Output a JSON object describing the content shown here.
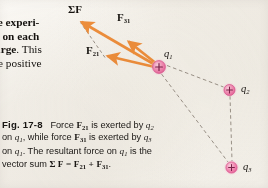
{
  "page": {
    "background_color": "#f5f2ec",
    "width": 268,
    "height": 188
  },
  "body_text": {
    "lines": [
      "ge experi-",
      "g on each",
      "arge. This",
      "ee positive"
    ]
  },
  "caption": {
    "figure_number": "Fig. 17-8",
    "lines": [
      "Force F21 is exerted by q2",
      "on q1, while force F31 is exerted by q3",
      "on q1. The resultant force on q1 is the",
      "vector sum Σ F = F21 + F31."
    ],
    "full_text": "Fig. 17-8  Force F21 is exerted by q2 on q1, while force F31 is exerted by q3 on q1. The resultant force on q1 is the resultant vector sum ΣF = F21 + F31."
  },
  "diagram": {
    "vector_color": "#ef8f3c",
    "charge_fill_color": "#f07ba8",
    "charge_halo_color": "#f6bcd3",
    "dashed_line_color": "#8a8176",
    "labels": {
      "resultant": "ΣF",
      "force_31": "F31",
      "force_21": "F21",
      "charge_1": "q1",
      "charge_2": "q2",
      "charge_3": "q3",
      "charge_sign": "+"
    },
    "charges": [
      {
        "name": "q1",
        "label": "q1",
        "sign": "+",
        "x": 159,
        "y": 67,
        "radius": 7
      },
      {
        "name": "q2",
        "label": "q2",
        "sign": "+",
        "x": 230,
        "y": 89,
        "radius": 6
      },
      {
        "name": "q3",
        "label": "q3",
        "sign": "+",
        "x": 232,
        "y": 168,
        "radius": 6
      }
    ],
    "vectors": [
      {
        "name": "resultant-sum",
        "label": "ΣF",
        "from_x": 159,
        "from_y": 67,
        "to_x": 78,
        "to_y": 19
      },
      {
        "name": "force-31",
        "label": "F31",
        "from_x": 159,
        "from_y": 67,
        "to_x": 126,
        "to_y": 39
      },
      {
        "name": "force-21",
        "label": "F21",
        "from_x": 159,
        "from_y": 67,
        "to_x": 104,
        "to_y": 55
      }
    ],
    "dashed_segments": [
      {
        "name": "q1-to-q2",
        "from_x": 166,
        "from_y": 66,
        "to_x": 224,
        "to_y": 87
      },
      {
        "name": "q1-to-q3",
        "from_x": 161,
        "from_y": 74,
        "to_x": 228,
        "to_y": 162
      },
      {
        "name": "q2-to-q3",
        "from_x": 230,
        "from_y": 96,
        "to_x": 232,
        "to_y": 161
      },
      {
        "name": "parallelogram-side",
        "from_x": 104,
        "from_y": 57,
        "to_x": 79,
        "to_y": 22
      }
    ]
  }
}
